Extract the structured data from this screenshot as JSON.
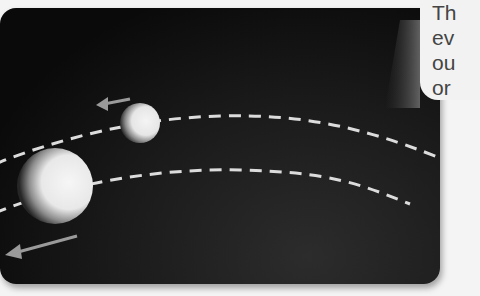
{
  "diagram": {
    "colors": {
      "background": "#0f0f0f",
      "path": "#dcdcdc",
      "sphere_light": "#f0f0f0",
      "sphere_shadow": "#2a2a2a",
      "arrow": "#9a9a9a",
      "callout_bg": "#f2f2f2",
      "callout_text": "#444444"
    },
    "bodies": [
      {
        "name": "near-sphere",
        "cx": 140,
        "cy": 123,
        "r": 20
      },
      {
        "name": "far-sphere",
        "cx": 55,
        "cy": 186,
        "r": 37
      }
    ],
    "arrows": [
      {
        "name": "near-motion-arrow",
        "direction": "left"
      },
      {
        "name": "far-motion-arrow",
        "direction": "down-left"
      }
    ],
    "callout": {
      "lines": [
        "Th",
        "ev",
        "ou",
        "or"
      ]
    }
  }
}
